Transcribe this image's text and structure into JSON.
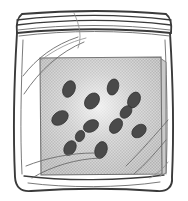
{
  "scene": {
    "title": "Zip-lock plastic bag containing a gray square with dark seeds",
    "alt_text": "Hand-drawn line illustration of a clear resealable plastic bag. Inside is a light gray square sheet scattered with about twelve small dark elliptical seeds.",
    "style": "hand-drawn black ink line art, halftone gray fill",
    "background_color": "#ffffff"
  },
  "bag": {
    "label": "plastic zip-lock bag",
    "outline_color": "#3a3a3a",
    "fill_color": "#ffffff",
    "seal_line_count": 4,
    "crease_line_count": 7,
    "seal_label": "zip seal",
    "body_label": "bag body",
    "bottom_label": "bag bottom fold"
  },
  "inner_square": {
    "label": "gray square sheet",
    "fill_color": "#c2c2c2",
    "highlight_color": "#e2e2e2",
    "edge_color": "#6b6b6b",
    "x": 40,
    "y": 57,
    "width": 122,
    "height": 117
  },
  "seeds": {
    "label": "dark seeds",
    "count": 12,
    "fill_color": "#4a4a4a",
    "stroke_color": "#2e2e2e",
    "items": [
      {
        "cx": 69,
        "cy": 89,
        "rx": 6.0,
        "ry": 8.6,
        "rot": 22
      },
      {
        "cx": 92,
        "cy": 101,
        "rx": 6.6,
        "ry": 8.8,
        "rot": 38
      },
      {
        "cx": 113,
        "cy": 87,
        "rx": 5.6,
        "ry": 8.2,
        "rot": 16
      },
      {
        "cx": 134,
        "cy": 100,
        "rx": 5.8,
        "ry": 8.4,
        "rot": 28
      },
      {
        "cx": 60,
        "cy": 118,
        "rx": 6.4,
        "ry": 9.0,
        "rot": 55
      },
      {
        "cx": 91,
        "cy": 126,
        "rx": 5.8,
        "ry": 8.0,
        "rot": 62
      },
      {
        "cx": 116,
        "cy": 126,
        "rx": 5.6,
        "ry": 8.2,
        "rot": 35
      },
      {
        "cx": 139,
        "cy": 131,
        "rx": 5.8,
        "ry": 8.0,
        "rot": 50
      },
      {
        "cx": 70,
        "cy": 148,
        "rx": 5.6,
        "ry": 7.8,
        "rot": 30
      },
      {
        "cx": 101,
        "cy": 150,
        "rx": 6.0,
        "ry": 8.6,
        "rot": 18
      },
      {
        "cx": 126,
        "cy": 112,
        "rx": 5.0,
        "ry": 7.0,
        "rot": 40
      },
      {
        "cx": 80,
        "cy": 136,
        "rx": 4.4,
        "ry": 5.8,
        "rot": 25
      }
    ]
  }
}
